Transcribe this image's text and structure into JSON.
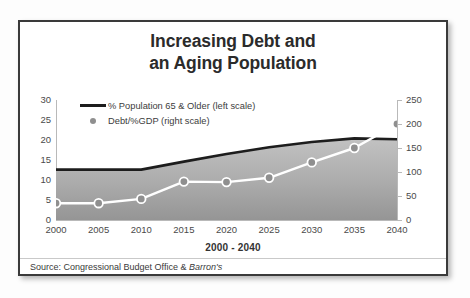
{
  "chart_data": {
    "type": "line",
    "title": "Increasing Debt and an Aging Population",
    "title_line1": "Increasing Debt and",
    "title_line2": "an Aging Population",
    "xlabel": "2000 - 2040",
    "ylabel": "",
    "categories": [
      "2000",
      "2005",
      "2010",
      "2015",
      "2020",
      "2025",
      "2030",
      "2035",
      "2040"
    ],
    "x": [
      2000,
      2005,
      2010,
      2015,
      2020,
      2025,
      2030,
      2035,
      2040
    ],
    "grid": false,
    "legend_position": "top-left",
    "series": [
      {
        "name": "% Population 65 & Older (left scale)",
        "axis": "left",
        "type": "area",
        "color": "#1d1d1d",
        "fill": "#a8a8a8",
        "values": [
          12.6,
          12.6,
          12.6,
          14.6,
          16.5,
          18.2,
          19.5,
          20.4,
          20.2
        ]
      },
      {
        "name": "Debt/%GDP (right scale)",
        "axis": "right",
        "type": "line-markers",
        "color": "#ffffff",
        "marker_color": "#8f8f8f",
        "values": [
          35,
          35,
          44,
          80,
          79,
          88,
          120,
          150,
          200
        ]
      }
    ],
    "yaxis_left": {
      "ticks": [
        "0",
        "5",
        "10",
        "15",
        "20",
        "25",
        "30"
      ],
      "tick_values": [
        0,
        5,
        10,
        15,
        20,
        25,
        30
      ],
      "ylim": [
        0,
        30
      ]
    },
    "yaxis_right": {
      "ticks": [
        "0",
        "50",
        "100",
        "150",
        "200",
        "250"
      ],
      "tick_values": [
        0,
        50,
        100,
        150,
        200,
        250
      ],
      "ylim": [
        0,
        250
      ]
    }
  },
  "legend": {
    "items": [
      {
        "label": "% Population 65 & Older (left scale)",
        "key": "line-key"
      },
      {
        "label": "Debt/%GDP (right scale)",
        "key": "dot-key"
      }
    ]
  },
  "footer": {
    "source_prefix": "Source: Congressional Budget Office & ",
    "source_italic": "Barron's"
  },
  "colors": {
    "frame": "#3a3a3a",
    "area_fill_top": "#bdbdbd",
    "area_fill_bottom": "#9a9a9a",
    "population_line": "#1d1d1d",
    "debt_line": "#ffffff",
    "debt_marker": "#8f8f8f",
    "axis": "#b9b9b9",
    "text": "#3c3c3c"
  }
}
